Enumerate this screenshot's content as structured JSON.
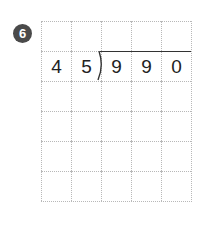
{
  "problem": {
    "number": "6",
    "divisor": [
      "4",
      "5"
    ],
    "dividend": [
      "9",
      "9",
      "0"
    ],
    "grid": [
      [
        "",
        "",
        "",
        "",
        ""
      ],
      [
        "4",
        "5",
        "9",
        "9",
        "0"
      ],
      [
        "",
        "",
        "",
        "",
        ""
      ],
      [
        "",
        "",
        "",
        "",
        ""
      ],
      [
        "",
        "",
        "",
        "",
        ""
      ],
      [
        "",
        "",
        "",
        "",
        ""
      ]
    ]
  }
}
